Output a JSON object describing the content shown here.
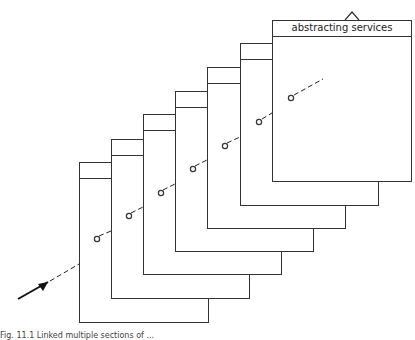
{
  "figure": {
    "panels": [
      {
        "label": "inde"
      },
      {
        "label": "infc"
      },
      {
        "label": "file"
      },
      {
        "label": "lite"
      },
      {
        "label": "perio"
      },
      {
        "label": "bibli"
      },
      {
        "label": "abstracting services"
      }
    ],
    "caption": "Fig. 11.1  Linked multiple sections of ..."
  }
}
